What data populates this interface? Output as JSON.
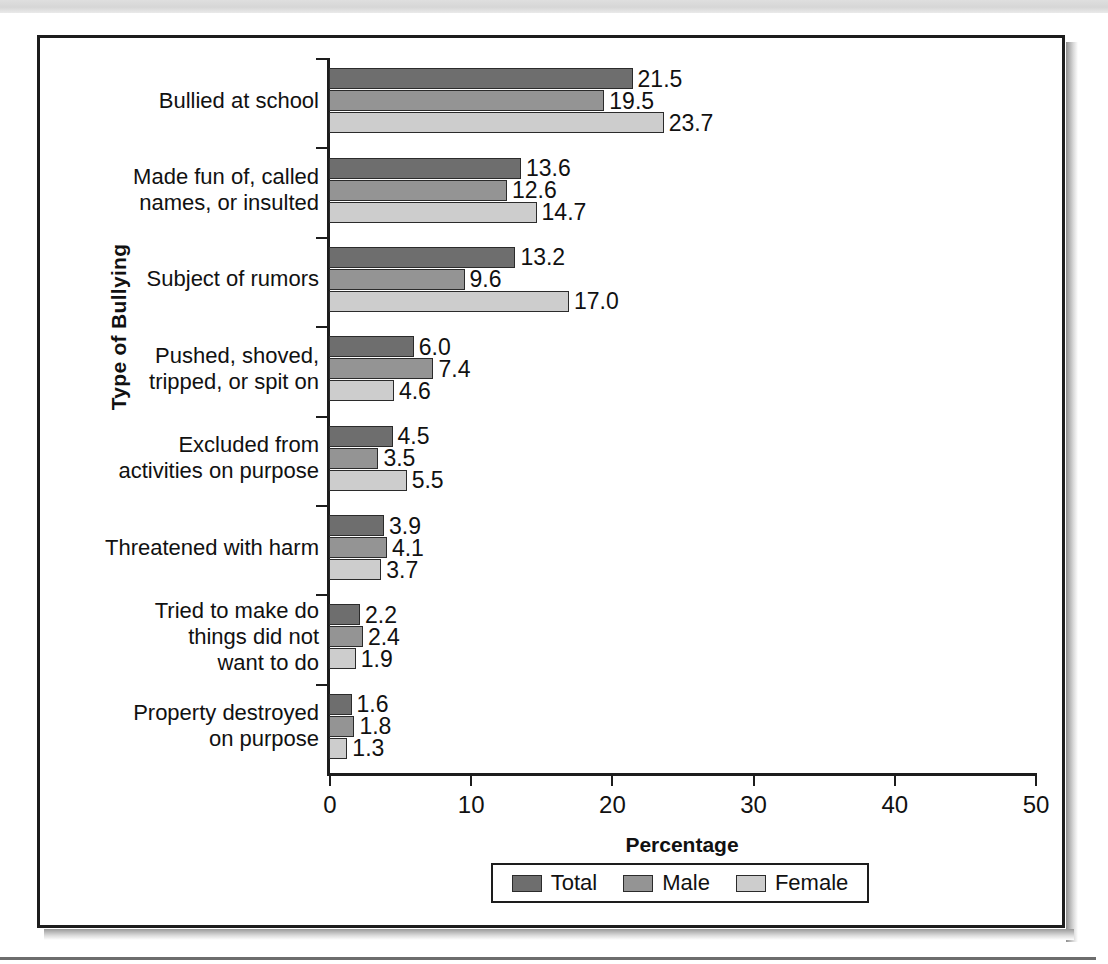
{
  "chart_data": {
    "type": "bar",
    "orientation": "horizontal",
    "title": "",
    "xlabel": "Percentage",
    "ylabel": "Type of Bullying",
    "xlim": [
      0,
      50
    ],
    "xticks": [
      "0",
      "10",
      "20",
      "30",
      "40",
      "50"
    ],
    "grid": false,
    "legend_position": "bottom",
    "categories": [
      "Bullied at school",
      "Made fun of, called\nnames, or insulted",
      "Subject of rumors",
      "Pushed, shoved,\ntripped, or spit on",
      "Excluded from\nactivities on purpose",
      "Threatened with harm",
      "Tried to make do\nthings did not\nwant to do",
      "Property destroyed\non purpose"
    ],
    "series": [
      {
        "name": "Total",
        "color": "#6e6e6e",
        "values": [
          21.5,
          13.6,
          13.2,
          6.0,
          4.5,
          3.9,
          2.2,
          1.6
        ],
        "labels": [
          "21.5",
          "13.6",
          "13.2",
          "6.0",
          "4.5",
          "3.9",
          "2.2",
          "1.6"
        ]
      },
      {
        "name": "Male",
        "color": "#949494",
        "values": [
          19.5,
          12.6,
          9.6,
          7.4,
          3.5,
          4.1,
          2.4,
          1.8
        ],
        "labels": [
          "19.5",
          "12.6",
          "9.6",
          "7.4",
          "3.5",
          "4.1",
          "2.4",
          "1.8"
        ]
      },
      {
        "name": "Female",
        "color": "#cdcdcd",
        "values": [
          23.7,
          14.7,
          17.0,
          4.6,
          5.5,
          3.7,
          1.9,
          1.3
        ],
        "labels": [
          "23.7",
          "14.7",
          "17.0",
          "4.6",
          "5.5",
          "3.7",
          "1.9",
          "1.3"
        ]
      }
    ]
  },
  "legend": {
    "items": [
      {
        "label": "Total"
      },
      {
        "label": "Male"
      },
      {
        "label": "Female"
      }
    ]
  }
}
